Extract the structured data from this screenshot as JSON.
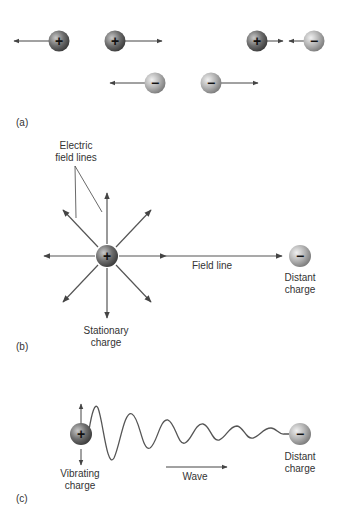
{
  "panels": {
    "a": {
      "label": "(a)",
      "description": "Like charges repel, opposite charges attract"
    },
    "b": {
      "label": "(b)",
      "electric_field_lines_label_1": "Electric",
      "electric_field_lines_label_2": "field lines",
      "field_line_label": "Field line",
      "stationary_label_1": "Stationary",
      "stationary_label_2": "charge",
      "distant_label_1": "Distant",
      "distant_label_2": "charge"
    },
    "c": {
      "label": "(c)",
      "vibrating_label_1": "Vibrating",
      "vibrating_label_2": "charge",
      "wave_label": "Wave",
      "distant_label_1": "Distant",
      "distant_label_2": "charge"
    }
  },
  "signs": {
    "plus": "+",
    "minus": "−"
  },
  "colors": {
    "positive": "#6a6a6a",
    "negative": "#b0b0b0",
    "arrow": "#555555"
  }
}
